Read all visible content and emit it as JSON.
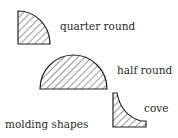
{
  "diagram": {
    "title": "molding shapes",
    "stroke_color": "#222222",
    "hatch_color": "#333333",
    "background": "#ffffff",
    "shapes": [
      {
        "id": "quarter-round",
        "label": "quarter round",
        "fill": "diagonal-hatch"
      },
      {
        "id": "half-round",
        "label": "half round",
        "fill": "diagonal-hatch"
      },
      {
        "id": "cove",
        "label": "cove",
        "fill": "diagonal-hatch"
      }
    ]
  }
}
